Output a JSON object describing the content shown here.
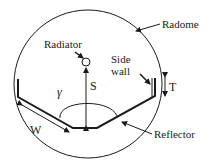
{
  "diagram": {
    "type": "antenna-cross-section",
    "labels": {
      "radome": "Radome",
      "radiator": "Radiator",
      "side_wall_line1": "Side",
      "side_wall_line2": "wall",
      "reflector": "Reflector",
      "gamma": "γ",
      "spacing": "S",
      "thickness": "T",
      "width": "W"
    },
    "colors": {
      "stroke": "#1a1a1a",
      "background": "#ffffff"
    }
  }
}
